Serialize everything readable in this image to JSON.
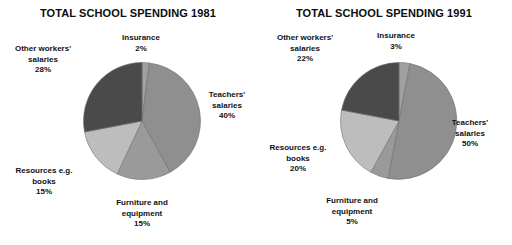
{
  "chart_data": [
    {
      "type": "pie",
      "title": "TOTAL SCHOOL SPENDING 1981",
      "categories": [
        "Insurance",
        "Teachers' salaries",
        "Furniture and equipment",
        "Resources e.g. books",
        "Other workers' salaries"
      ],
      "values": [
        2,
        40,
        15,
        15,
        28
      ],
      "labels": [
        {
          "name": "Insurance",
          "line1": "Insurance",
          "line2": "",
          "pct": "2%",
          "value": 2,
          "color": "#a0a0a0"
        },
        {
          "name": "Teachers' salaries",
          "line1": "Teachers'",
          "line2": "salaries",
          "pct": "40%",
          "value": 40,
          "color": "#8f8f8f"
        },
        {
          "name": "Furniture and equipment",
          "line1": "Furniture and",
          "line2": "equipment",
          "pct": "15%",
          "value": 15,
          "color": "#9a9a9a"
        },
        {
          "name": "Resources e.g. books",
          "line1": "Resources e.g.",
          "line2": "books",
          "pct": "15%",
          "value": 15,
          "color": "#bdbdbd"
        },
        {
          "name": "Other workers' salaries",
          "line1": "Other workers'",
          "line2": "salaries",
          "pct": "28%",
          "value": 28,
          "color": "#4a4a4a"
        }
      ],
      "legend": "none",
      "start_angle_deg": 0,
      "direction": "clockwise"
    },
    {
      "type": "pie",
      "title": "TOTAL SCHOOL SPENDING 1991",
      "categories": [
        "Insurance",
        "Teachers' salaries",
        "Furniture and equipment",
        "Resources e.g. books",
        "Other workers' salaries"
      ],
      "values": [
        3,
        50,
        5,
        20,
        22
      ],
      "labels": [
        {
          "name": "Insurance",
          "line1": "Insurance",
          "line2": "",
          "pct": "3%",
          "value": 3,
          "color": "#a0a0a0"
        },
        {
          "name": "Teachers' salaries",
          "line1": "Teachers'",
          "line2": "salaries",
          "pct": "50%",
          "value": 50,
          "color": "#8f8f8f"
        },
        {
          "name": "Furniture and equipment",
          "line1": "Furniture and",
          "line2": "equipment",
          "pct": "5%",
          "value": 5,
          "color": "#9a9a9a"
        },
        {
          "name": "Resources e.g. books",
          "line1": "Resources e.g.",
          "line2": "books",
          "pct": "20%",
          "value": 20,
          "color": "#bdbdbd"
        },
        {
          "name": "Other workers' salaries",
          "line1": "Other workers'",
          "line2": "salaries",
          "pct": "22%",
          "value": 22,
          "color": "#4a4a4a"
        }
      ],
      "legend": "none",
      "start_angle_deg": 0,
      "direction": "clockwise"
    }
  ],
  "colors": {
    "background": "#ffffff",
    "text": "#111111",
    "insurance": "#a0a0a0",
    "teachers": "#8f8f8f",
    "furniture": "#9a9a9a",
    "resources": "#bdbdbd",
    "other_workers": "#4a4a4a",
    "slice_outline": "#6e6e6e"
  }
}
